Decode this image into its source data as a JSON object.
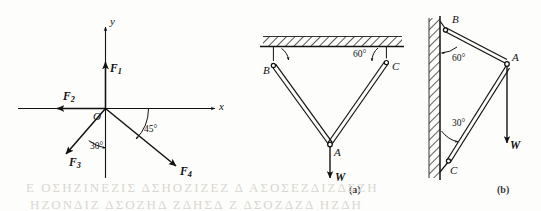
{
  "figure": {
    "background_color": "#fdfdfb",
    "ink_color": "#121212",
    "width": 541,
    "height": 211
  },
  "panels": [
    {
      "id": "force-diagram",
      "caption": "",
      "type": "concurrent-force-system",
      "axes": {
        "x_label": "x",
        "y_label": "y",
        "origin_label": "O"
      },
      "forces": [
        {
          "name": "F1",
          "label_base": "F",
          "label_sub": "1",
          "direction": "up",
          "angle_deg": 90,
          "note": "along +y axis"
        },
        {
          "name": "F2",
          "label_base": "F",
          "label_sub": "2",
          "direction": "left",
          "angle_deg": 180,
          "note": "along -x axis"
        },
        {
          "name": "F3",
          "label_base": "F",
          "label_sub": "3",
          "direction": "down-left",
          "angle_deg": 240,
          "note": "30 degrees from -y axis"
        },
        {
          "name": "F4",
          "label_base": "F",
          "label_sub": "4",
          "direction": "down-right",
          "angle_deg": -45,
          "note": "45 degrees below +x axis"
        }
      ],
      "angles": [
        {
          "value": "30",
          "unit": "°",
          "text": "30°",
          "between": "negative-y-axis and F3"
        },
        {
          "value": "45",
          "unit": "°",
          "text": "45°",
          "between": "positive-x-axis and F4"
        }
      ]
    },
    {
      "id": "panel-a",
      "caption": "(a)",
      "type": "two-cable-ceiling-support",
      "support": "hatched horizontal ceiling",
      "points": [
        {
          "label": "B",
          "note": "left ceiling attachment"
        },
        {
          "label": "C",
          "note": "right ceiling attachment"
        },
        {
          "label": "A",
          "note": "lower joint where cables meet"
        }
      ],
      "angles": [
        {
          "value": "",
          "unit": "",
          "text": "",
          "at": "B",
          "note": "arc drawn, value not labelled"
        },
        {
          "value": "60",
          "unit": "°",
          "text": "60°",
          "at": "C",
          "note": "between ceiling and cable CA"
        }
      ],
      "load": {
        "label": "W",
        "direction": "down",
        "note": "weight hanging at A"
      }
    },
    {
      "id": "panel-b",
      "caption": "(b)",
      "type": "wall-bracket-support",
      "support": "hatched vertical wall",
      "points": [
        {
          "label": "B",
          "note": "upper wall attachment"
        },
        {
          "label": "C",
          "note": "lower wall attachment"
        },
        {
          "label": "A",
          "note": "outer joint carrying the load"
        }
      ],
      "angles": [
        {
          "value": "60",
          "unit": "°",
          "text": "60°",
          "at": "B",
          "note": "between wall and member BA"
        },
        {
          "value": "30",
          "unit": "°",
          "text": "30°",
          "at": "C",
          "note": "between wall and member CA"
        }
      ],
      "load": {
        "label": "W",
        "direction": "down",
        "note": "weight hanging at A"
      }
    }
  ],
  "captions": {
    "a": "(a)",
    "b": "(b)"
  },
  "bleed_through": {
    "line1": "Ε ΟΣΗΖΙΝΕΖΙΣ  ΔΣΗΟΖΙΖΕΖ  Δ   ΑΣΟΣΕΖΔΙΖΔΣΖΗ",
    "line2": "ΗΖΟΝΔΙΖ  ΔΣΟΖΗΔ  ΖΔΗΣΔ  Ζ  ΔΣΟΖΔΖΔ  ΗΖΔΗ"
  }
}
